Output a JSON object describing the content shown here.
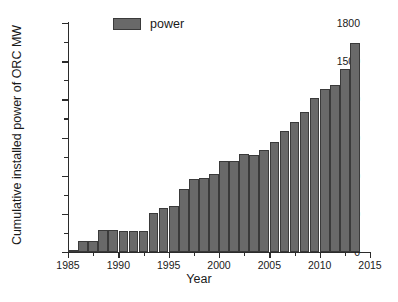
{
  "chart_data": {
    "type": "bar",
    "title": "",
    "xlabel": "Year",
    "ylabel": "Cumulative installed power of ORC MW",
    "xlim": [
      1985,
      2015
    ],
    "ylim": [
      0,
      1800
    ],
    "ytick_labels": [
      "0",
      "300",
      "600",
      "900",
      "1200",
      "1500",
      "1800"
    ],
    "ytick_values": [
      0,
      300,
      600,
      900,
      1200,
      1500,
      1800
    ],
    "ytick_minor_values": [
      150,
      450,
      750,
      1050,
      1350,
      1650
    ],
    "xtick_labels": [
      "1985",
      "1990",
      "1995",
      "2000",
      "2005",
      "2010",
      "2015"
    ],
    "xtick_values": [
      1985,
      1990,
      1995,
      2000,
      2005,
      2010,
      2015
    ],
    "xtick_minor_values": [
      1987.5,
      1992.5,
      1997.5,
      2002.5,
      2007.5,
      2012.5
    ],
    "grid": false,
    "legend_position": "top-left",
    "series": [
      {
        "name": "power",
        "color": "#696969",
        "edge_color": "#3a3a3a",
        "categories": [
          1985,
          1986,
          1987,
          1988,
          1989,
          1990,
          1991,
          1992,
          1993,
          1994,
          1995,
          1996,
          1997,
          1998,
          1999,
          2000,
          2001,
          2002,
          2003,
          2004,
          2005,
          2006,
          2007,
          2008,
          2009,
          2010,
          2011,
          2012,
          2013
        ],
        "values": [
          8,
          90,
          90,
          172,
          170,
          168,
          168,
          166,
          308,
          345,
          362,
          495,
          575,
          578,
          615,
          718,
          715,
          770,
          763,
          805,
          865,
          955,
          1025,
          1100,
          1208,
          1282,
          1312,
          1440,
          1640
        ]
      }
    ]
  },
  "legend": {
    "label": "power"
  },
  "axis": {
    "x_title": "Year",
    "y_title": "Cumulative installed power of ORC MW"
  },
  "colors": {
    "bar_fill": "#696969",
    "bar_edge": "#3a3a3a",
    "axis": "#2b2b2b",
    "text": "#1a1a1a",
    "background": "#ffffff"
  }
}
